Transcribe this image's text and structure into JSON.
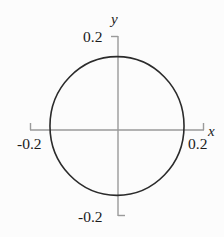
{
  "figure": {
    "kind": "cartesian-plot",
    "background_color": "#fcfcfc",
    "axis_color": "#9a9a9a",
    "curve_color": "#2b2b2b",
    "text_color": "#1b1b1b"
  },
  "axes": {
    "x_axis_label": "x",
    "y_axis_label": "y",
    "x_tick_labels": {
      "min": "-0.2",
      "max": "0.2"
    },
    "y_tick_labels": {
      "min": "-0.2",
      "max": "0.2"
    }
  },
  "chart_data": {
    "type": "line",
    "title": "",
    "xlabel": "x",
    "ylabel": "y",
    "xlim": [
      -0.2,
      0.2
    ],
    "ylim": [
      -0.2,
      0.2
    ],
    "xticks": [
      -0.2,
      0.2
    ],
    "yticks": [
      -0.2,
      0.2
    ],
    "xticklabels": [
      "-0.2",
      "0.2"
    ],
    "yticklabels": [
      "-0.2",
      "0.2"
    ],
    "grid": false,
    "legend": null,
    "series": [
      {
        "name": "circle",
        "shape": "circle",
        "center": [
          0.0,
          0.0
        ],
        "radius": 0.155,
        "closed": true,
        "linewidth": 1.6,
        "color": "#2b2b2b",
        "equation": "x^2 + y^2 = 0.024",
        "x": [
          0.155,
          0.143,
          0.11,
          0.06,
          0.0,
          -0.06,
          -0.11,
          -0.143,
          -0.155,
          -0.143,
          -0.11,
          -0.06,
          0.0,
          0.06,
          0.11,
          0.143,
          0.155
        ],
        "y": [
          0.0,
          0.06,
          0.11,
          0.143,
          0.155,
          0.143,
          0.11,
          0.06,
          0.0,
          -0.06,
          -0.11,
          -0.143,
          -0.155,
          -0.143,
          -0.11,
          -0.06,
          0.0
        ]
      }
    ]
  }
}
